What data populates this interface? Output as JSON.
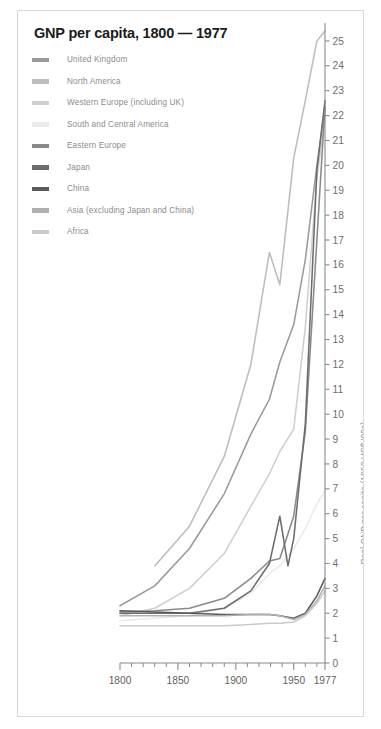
{
  "figure": {
    "title": "GNP per capita, 1800 — 1977",
    "border_color": "#d8d8d8",
    "background": "#ffffff"
  },
  "legend": {
    "items": [
      {
        "label": "United Kingdom",
        "color": "#9a9a9a",
        "swatch": "legend-swatch-united-kingdom"
      },
      {
        "label": "North America",
        "color": "#bdbdbd",
        "swatch": "legend-swatch-north-america"
      },
      {
        "label": "Western Europe (including UK)",
        "color": "#cfcfcf",
        "swatch": "legend-swatch-western-europe"
      },
      {
        "label": "South and Central America",
        "color": "#eaeaea",
        "swatch": "legend-swatch-south-central-america"
      },
      {
        "label": "Eastern Europe",
        "color": "#8a8a8a",
        "swatch": "legend-swatch-eastern-europe"
      },
      {
        "label": "Japan",
        "color": "#6d6d6d",
        "swatch": "legend-swatch-japan"
      },
      {
        "label": "China",
        "color": "#5a5a5a",
        "swatch": "legend-swatch-china"
      },
      {
        "label": "Asia (excluding Japan and China)",
        "color": "#b0b0b0",
        "swatch": "legend-swatch-asia"
      },
      {
        "label": "Africa",
        "color": "#cacaca",
        "swatch": "legend-swatch-africa"
      }
    ]
  },
  "axes": {
    "y_axis_title": "Real GNP per capita (1960 US$ '00s)",
    "y_ticks": [
      0,
      1,
      2,
      3,
      4,
      5,
      6,
      7,
      8,
      9,
      10,
      11,
      12,
      13,
      14,
      15,
      16,
      17,
      18,
      19,
      20,
      21,
      22,
      23,
      24,
      25
    ],
    "y_tick_labels": [
      "0",
      "1",
      "2",
      "3",
      "4",
      "5",
      "6",
      "7",
      "8",
      "9",
      "10",
      "11",
      "12",
      "13",
      "14",
      "15",
      "16",
      "17",
      "18",
      "19",
      "20",
      "21",
      "22",
      "23",
      "24",
      "25"
    ],
    "y_range": [
      0,
      25.6
    ],
    "x_ticks_major": [
      1800,
      1850,
      1900,
      1950,
      1977
    ],
    "x_tick_labels": [
      "1800",
      "1850",
      "1900",
      "1950",
      "1977"
    ],
    "x_ticks_minor": [
      1810,
      1820,
      1830,
      1840,
      1860,
      1870,
      1880,
      1890,
      1910,
      1920,
      1930,
      1940,
      1960,
      1970
    ],
    "x_range": [
      1800,
      1977
    ],
    "axis_color": "#8a8a8a",
    "tick_label_color": "#6e6e6e"
  },
  "chart_data": {
    "type": "line",
    "title": "GNP per capita, 1800 — 1977",
    "xlabel": "",
    "ylabel": "Real GNP per capita (1960 US$ '00s)",
    "xlim": [
      1800,
      1977
    ],
    "ylim": [
      0,
      25.6
    ],
    "grid": false,
    "legend_position": "top-left",
    "x": [
      1800,
      1830,
      1860,
      1890,
      1913,
      1929,
      1938,
      1950,
      1960,
      1970,
      1977
    ],
    "series": [
      {
        "name": "United Kingdom",
        "color": "#9a9a9a",
        "x": [
          1800,
          1830,
          1860,
          1890,
          1913,
          1929,
          1938,
          1950,
          1960,
          1970,
          1977
        ],
        "values": [
          2.3,
          3.1,
          4.6,
          6.8,
          9.2,
          10.6,
          12.1,
          13.6,
          16.2,
          20.0,
          22.3
        ]
      },
      {
        "name": "North America",
        "color": "#bdbdbd",
        "x": [
          1830,
          1860,
          1890,
          1913,
          1929,
          1938,
          1950,
          1960,
          1970,
          1977
        ],
        "values": [
          3.9,
          5.5,
          8.3,
          12.0,
          16.5,
          15.2,
          20.3,
          22.6,
          25.0,
          25.4
        ]
      },
      {
        "name": "Western Europe (including UK)",
        "color": "#cfcfcf",
        "x": [
          1800,
          1830,
          1860,
          1890,
          1913,
          1929,
          1938,
          1950,
          1960,
          1970,
          1977
        ],
        "values": [
          1.9,
          2.2,
          3.0,
          4.4,
          6.3,
          7.6,
          8.5,
          9.4,
          13.5,
          19.5,
          22.0
        ]
      },
      {
        "name": "South and Central America",
        "color": "#eaeaea",
        "x": [
          1800,
          1830,
          1860,
          1890,
          1913,
          1929,
          1938,
          1950,
          1960,
          1970,
          1977
        ],
        "values": [
          1.7,
          1.8,
          1.9,
          2.2,
          2.8,
          3.6,
          3.9,
          4.6,
          5.4,
          6.4,
          6.9
        ]
      },
      {
        "name": "Eastern Europe",
        "color": "#8a8a8a",
        "x": [
          1800,
          1830,
          1860,
          1890,
          1913,
          1929,
          1938,
          1950,
          1960,
          1970,
          1977
        ],
        "values": [
          2.05,
          2.1,
          2.2,
          2.6,
          3.4,
          4.1,
          4.2,
          5.9,
          9.3,
          17.0,
          22.4
        ]
      },
      {
        "name": "Japan",
        "color": "#6d6d6d",
        "x": [
          1800,
          1830,
          1860,
          1890,
          1913,
          1929,
          1938,
          1945,
          1950,
          1960,
          1970,
          1977
        ],
        "values": [
          2.0,
          2.0,
          2.0,
          2.2,
          2.9,
          4.0,
          5.9,
          3.9,
          5.0,
          9.6,
          19.8,
          22.6
        ]
      },
      {
        "name": "China",
        "color": "#5a5a5a",
        "x": [
          1800,
          1830,
          1860,
          1890,
          1913,
          1929,
          1938,
          1950,
          1960,
          1970,
          1977
        ],
        "values": [
          2.1,
          2.05,
          2.0,
          1.95,
          1.95,
          1.95,
          1.9,
          1.8,
          2.0,
          2.7,
          3.4
        ]
      },
      {
        "name": "Asia (excluding Japan and China)",
        "color": "#b0b0b0",
        "x": [
          1800,
          1830,
          1860,
          1890,
          1913,
          1929,
          1938,
          1950,
          1960,
          1970,
          1977
        ],
        "values": [
          1.9,
          1.9,
          1.9,
          1.9,
          1.95,
          1.95,
          1.9,
          1.75,
          1.95,
          2.5,
          3.1
        ]
      },
      {
        "name": "Africa",
        "color": "#cacaca",
        "x": [
          1800,
          1830,
          1860,
          1890,
          1913,
          1929,
          1938,
          1950,
          1960,
          1970,
          1977
        ],
        "values": [
          1.5,
          1.5,
          1.5,
          1.5,
          1.55,
          1.6,
          1.6,
          1.65,
          1.9,
          2.4,
          2.9
        ]
      }
    ]
  }
}
